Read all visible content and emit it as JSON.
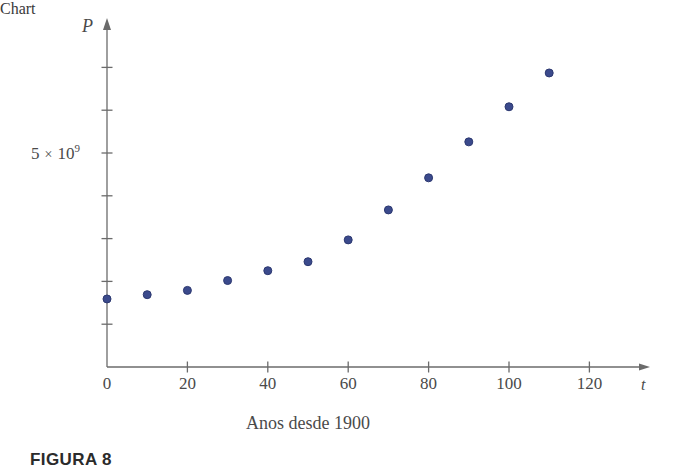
{
  "figure": {
    "caption": "FIGURA 8"
  },
  "chart_data": {
    "type": "scatter",
    "title": "",
    "subtitle": "",
    "xlabel": "Anos desde 1900",
    "ylabel": "P",
    "x_symbol": "t",
    "y_symbol": "P",
    "grid": false,
    "legend": null,
    "xlim": [
      0,
      130
    ],
    "ylim": [
      0,
      7700000000
    ],
    "x_ticks": [
      0,
      20,
      40,
      60,
      80,
      100,
      120
    ],
    "x_tick_labels": [
      "0",
      "20",
      "40",
      "60",
      "80",
      "100",
      "120"
    ],
    "y_ticks": [
      1000000000,
      2000000000,
      3000000000,
      4000000000,
      5000000000,
      6000000000,
      7000000000
    ],
    "y_tick_labels": [
      "",
      "",
      "",
      "",
      "5 × 10⁹",
      "",
      ""
    ],
    "y_labeled_tick": {
      "value": 5000000000,
      "mantissa": "5",
      "times": "×",
      "base": "10",
      "exponent": "9",
      "text": "5 × 10⁹"
    },
    "marker": {
      "shape": "circle",
      "radius": 4,
      "fill": "#3b4a8c",
      "edge": "#2c3870"
    },
    "axis_color": "#6b6b6b",
    "x": [
      0,
      10,
      20,
      30,
      40,
      50,
      60,
      70,
      80,
      90,
      100,
      110
    ],
    "y": [
      1590000000,
      1690000000,
      1790000000,
      2020000000,
      2250000000,
      2460000000,
      2970000000,
      3670000000,
      4420000000,
      5260000000,
      6080000000,
      6870000000
    ],
    "points": [
      {
        "t": 0,
        "P": 1590000000
      },
      {
        "t": 10,
        "P": 1690000000
      },
      {
        "t": 20,
        "P": 1790000000
      },
      {
        "t": 30,
        "P": 2020000000
      },
      {
        "t": 40,
        "P": 2250000000
      },
      {
        "t": 50,
        "P": 2460000000
      },
      {
        "t": 60,
        "P": 2970000000
      },
      {
        "t": 70,
        "P": 3670000000
      },
      {
        "t": 80,
        "P": 4420000000
      },
      {
        "t": 90,
        "P": 5260000000
      },
      {
        "t": 100,
        "P": 6080000000
      },
      {
        "t": 110,
        "P": 6870000000
      }
    ]
  }
}
